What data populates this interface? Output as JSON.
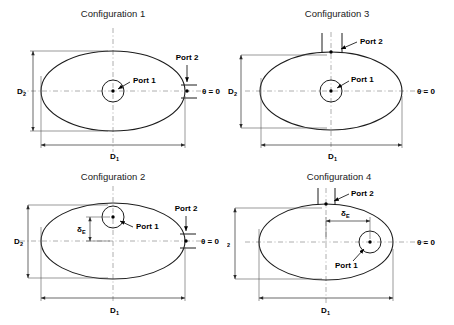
{
  "panels": [
    {
      "id": "configuration-1",
      "title": "Configuration 1",
      "port1_label": "Port 1",
      "port2_label": "Port 2",
      "theta_label": "θ = 0",
      "dim_major_label": "D",
      "dim_major_sub": "1",
      "dim_minor_label": "D",
      "dim_minor_sub": "2",
      "offset_label": "",
      "offset_sub": "",
      "port1_position": "center",
      "port2_position": "right-edge-on-axis",
      "has_offset": false
    },
    {
      "id": "configuration-3",
      "title": "Configuration 3",
      "port1_label": "Port 1",
      "port2_label": "Port 2",
      "theta_label": "θ = 0",
      "dim_major_label": "D",
      "dim_major_sub": "1",
      "dim_minor_label": "D",
      "dim_minor_sub": "2",
      "offset_label": "",
      "offset_sub": "",
      "port1_position": "center",
      "port2_position": "top-vertical-axis",
      "has_offset": false
    },
    {
      "id": "configuration-2",
      "title": "Configuration 2",
      "port1_label": "Port 1",
      "port2_label": "Port 2",
      "theta_label": "θ = 0",
      "dim_major_label": "D",
      "dim_major_sub": "1",
      "dim_minor_label": "D",
      "dim_minor_sub": "2",
      "offset_label": "δ",
      "offset_sub": "E",
      "port1_position": "offset-vertically-above-center",
      "port2_position": "right-edge-on-axis",
      "has_offset": true
    },
    {
      "id": "configuration-4",
      "title": "Configuration 4",
      "port1_label": "Port 1",
      "port2_label": "Port 2",
      "theta_label": "θ = 0",
      "dim_major_label": "D",
      "dim_major_sub": "1",
      "dim_minor_label": "D",
      "dim_minor_sub": "2",
      "offset_label": "δ",
      "offset_sub": "E",
      "port1_position": "offset-horizontally-right-of-center",
      "port2_position": "top-vertical-axis",
      "has_offset": true
    }
  ],
  "colors": {
    "outline": "#1c1c1c",
    "centerline": "#9a9a9a",
    "dimension": "#2a2a2a",
    "text": "#000000",
    "background": "#ffffff"
  }
}
